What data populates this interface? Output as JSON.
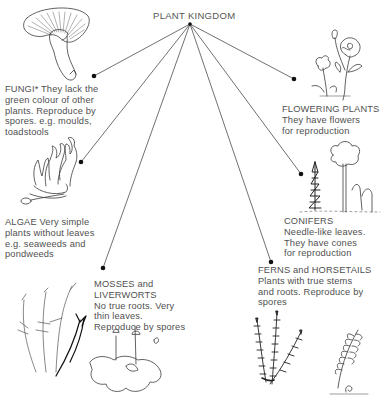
{
  "diagram": {
    "title": "PLANT KINGDOM",
    "hub": {
      "x": 190,
      "y": 24
    },
    "line_color": "#333333",
    "dot_color": "#111111",
    "groups": [
      {
        "id": "fungi",
        "heading": "FUNGI*",
        "lines": [
          "They lack the",
          "green colour of other",
          "plants. Reproduce by",
          "spores. e.g. moulds,",
          "toadstools"
        ],
        "inline_heading": true,
        "dot": {
          "x": 94,
          "y": 76
        },
        "illustration": "mushroom-illustration"
      },
      {
        "id": "algae",
        "heading": "ALGAE",
        "lines": [
          "Very simple",
          "plants without leaves",
          "e.g. seaweeds and",
          "pondweeds"
        ],
        "inline_heading": true,
        "dot": {
          "x": 81,
          "y": 162
        },
        "illustration": "seaweed-illustration"
      },
      {
        "id": "mosses",
        "heading": "MOSSES and",
        "lines": [
          "LIVERWORTS",
          "No true roots. Very",
          "thin leaves.",
          "Reproduce by spores"
        ],
        "inline_heading": false,
        "dot": {
          "x": 103,
          "y": 268
        },
        "illustration": "moss-liverwort-illustration"
      },
      {
        "id": "ferns",
        "heading": "FERNS and HORSETAILS",
        "lines": [
          "Plants with true stems",
          "and roots. Reproduce by",
          "spores"
        ],
        "inline_heading": false,
        "dot": {
          "x": 271,
          "y": 262
        },
        "illustration": "fern-horsetail-illustration"
      },
      {
        "id": "conifers",
        "heading": "CONIFERS",
        "lines": [
          "Needle-like leaves.",
          "They have cones",
          "for reproduction"
        ],
        "inline_heading": false,
        "dot": {
          "x": 301,
          "y": 174
        },
        "illustration": "conifer-tree-illustration"
      },
      {
        "id": "flowering",
        "heading": "FLOWERING PLANTS",
        "lines": [
          "They have flowers",
          "for reproduction"
        ],
        "inline_heading": false,
        "dot": {
          "x": 294,
          "y": 79
        },
        "illustration": "rose-flower-illustration"
      }
    ]
  }
}
